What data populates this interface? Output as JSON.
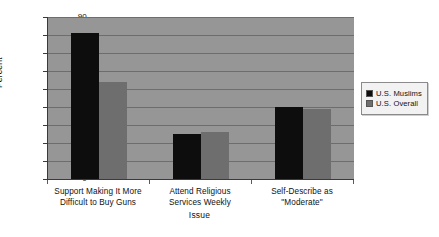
{
  "chart_data": {
    "type": "bar",
    "title": "",
    "xlabel": "Issue",
    "ylabel": "Percent",
    "ylim": [
      0,
      90
    ],
    "ytick_step": 10,
    "yticks": [
      90,
      80,
      70,
      60,
      50,
      40,
      30,
      20,
      10,
      0
    ],
    "grid": true,
    "legend_position": "right",
    "categories": [
      "Support Making It More Difficult to Buy Guns",
      "Attend Religious Services Weekly",
      "Self-Describe as \"Moderate\""
    ],
    "category_lines": [
      [
        "Support Making It More",
        "Difficult to Buy Guns"
      ],
      [
        "Attend Religious",
        "Services Weekly"
      ],
      [
        "Self-Describe as",
        "\"Moderate\""
      ]
    ],
    "series": [
      {
        "name": "U.S. Muslims",
        "color": "#0d0d0d",
        "values": [
          81,
          25,
          40
        ]
      },
      {
        "name": "U.S. Overall",
        "color": "#6e6e6e",
        "values": [
          54,
          26,
          39
        ]
      }
    ]
  },
  "legend": {
    "items": [
      {
        "label": "U.S. Muslims",
        "color": "#0d0d0d"
      },
      {
        "label": "U.S. Overall",
        "color": "#6e6e6e"
      }
    ]
  },
  "colors": {
    "plot_background": "#969696",
    "page_background": "#ffffff",
    "gridline": "#6d6d6d",
    "axis": "#3a3a3a",
    "series_1": "#0d0d0d",
    "series_2": "#6e6e6e",
    "legend_background": "#f2f2f2"
  }
}
